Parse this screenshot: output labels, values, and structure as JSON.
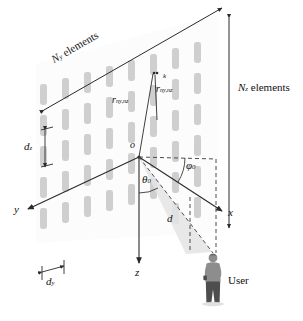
{
  "figure": {
    "type": "antenna-array-geometry-diagram"
  },
  "dimensions": {
    "ny_label_prefix": "N",
    "ny_label_sub": "y",
    "ny_label_word": "elements",
    "nz_label_prefix": "N",
    "nz_label_sub": "z",
    "nz_label_word": "elements"
  },
  "spacing": {
    "dy_symbol": "d",
    "dy_sub": "y",
    "dz_symbol": "d",
    "dz_sub": "z"
  },
  "axes": {
    "x": "x",
    "y": "y",
    "z": "z",
    "origin": "o"
  },
  "angles": {
    "theta_symbol": "θ",
    "theta_sub": "0",
    "phi_symbol": "φ",
    "phi_sub": "0"
  },
  "vectors": {
    "r_symbol": "r",
    "r_sub": "ny,nz",
    "rk_symbol": "r",
    "rk_sup": "k",
    "rk_sub": "ny,nz"
  },
  "distance": {
    "d_symbol": "d"
  },
  "user": {
    "label": "User"
  },
  "colors": {
    "element_fill": "#cfcfcf",
    "panel_fill": "#fbfbfb",
    "line": "#2a2a2a",
    "dashed": "#3a3a3a",
    "beam": "#dedede",
    "user_body": "#8a8a8a",
    "user_dark": "#5a5a5a"
  },
  "array_grid": {
    "columns": 8,
    "rows": 6
  }
}
